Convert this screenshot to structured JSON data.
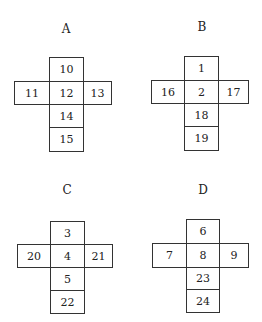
{
  "nets": [
    {
      "label": "A",
      "title_pos": [
        66,
        29
      ],
      "col": [
        49,
        83
      ],
      "row": [
        14,
        111
      ],
      "y": [
        57,
        81,
        104,
        127,
        151
      ],
      "cells": {
        "top": "10",
        "left": "11",
        "center": "12",
        "right": "13",
        "below1": "14",
        "below2": "15"
      }
    },
    {
      "label": "B",
      "title_pos": [
        202,
        27
      ],
      "col": [
        184,
        218
      ],
      "row": [
        151,
        248
      ],
      "y": [
        56,
        80,
        103,
        126,
        150
      ],
      "cells": {
        "top": "1",
        "left": "16",
        "center": "2",
        "right": "17",
        "below1": "18",
        "below2": "19"
      }
    },
    {
      "label": "C",
      "title_pos": [
        67,
        190
      ],
      "col": [
        50,
        84
      ],
      "row": [
        17,
        112
      ],
      "y": [
        221,
        244,
        267,
        290,
        313
      ],
      "cells": {
        "top": "3",
        "left": "20",
        "center": "4",
        "right": "21",
        "below1": "5",
        "below2": "22"
      }
    },
    {
      "label": "D",
      "title_pos": [
        203,
        190
      ],
      "col": [
        186,
        219
      ],
      "row": [
        152,
        248
      ],
      "y": [
        219,
        243,
        267,
        289,
        312
      ],
      "cells": {
        "top": "6",
        "left": "7",
        "center": "8",
        "right": "9",
        "below1": "23",
        "below2": "24"
      }
    }
  ]
}
